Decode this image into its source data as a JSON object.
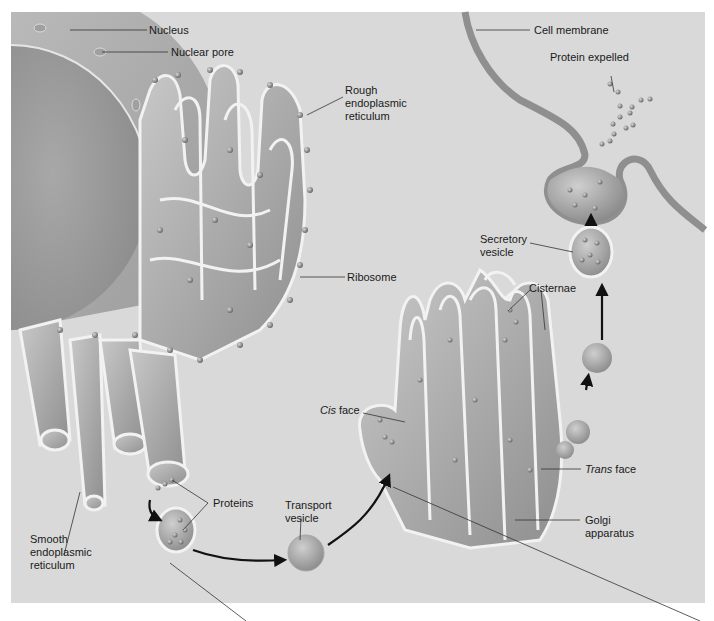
{
  "diagram": {
    "background_color": "#d9d9d9",
    "labels": {
      "nucleus": "Nucleus",
      "nuclear_pore": "Nuclear pore",
      "rough_er_1": "Rough",
      "rough_er_2": "endoplasmic",
      "rough_er_3": "reticulum",
      "ribosome": "Ribosome",
      "smooth_er_1": "Smooth",
      "smooth_er_2": "endoplasmic",
      "smooth_er_3": "reticulum",
      "proteins": "Proteins",
      "transport_vesicle_1": "Transport",
      "transport_vesicle_2": "vesicle",
      "cis_italic": "Cis",
      "cis_rest": " face",
      "trans_italic": "Trans",
      "trans_rest": " face",
      "golgi_1": "Golgi",
      "golgi_2": "apparatus",
      "cisternae": "Cisternae",
      "secretory_vesicle_1": "Secretory",
      "secretory_vesicle_2": "vesicle",
      "cell_membrane": "Cell membrane",
      "protein_expelled": "Protein expelled"
    },
    "flow": [
      "Rough endoplasmic reticulum",
      "Transport vesicle",
      "Golgi apparatus (cis face)",
      "Golgi apparatus (trans face)",
      "Secretory vesicle",
      "Cell membrane",
      "Protein expelled"
    ]
  }
}
